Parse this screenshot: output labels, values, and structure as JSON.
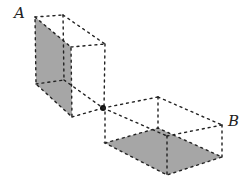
{
  "labels": {
    "a": "A",
    "b": "B"
  },
  "colors": {
    "face": "#a6a6a6",
    "edge": "#222222"
  }
}
